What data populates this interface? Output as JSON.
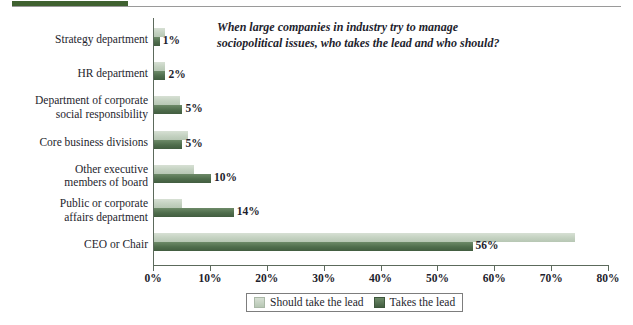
{
  "top_bar": {
    "accent_color": "#3f6130",
    "rule_color": "#9a9a9a"
  },
  "chart_data": {
    "type": "bar",
    "orientation": "horizontal",
    "title": "When large companies in industry try to manage\nsociopolitical issues, who takes the lead and who should?",
    "xlabel": "",
    "ylabel": "",
    "xlim": [
      0,
      80
    ],
    "grid": false,
    "legend_position": "bottom-center",
    "categories": [
      "Strategy department",
      "HR department",
      "Department of corporate\nsocial responsibility",
      "Core business divisions",
      "Other executive\nmembers of board",
      "Public or corporate\naffairs department",
      "CEO or Chair"
    ],
    "tick_labels": [
      "0%",
      "10%",
      "20%",
      "30%",
      "40%",
      "50%",
      "60%",
      "70%",
      "80%"
    ],
    "tick_values": [
      0,
      10,
      20,
      30,
      40,
      50,
      60,
      70,
      80
    ],
    "series": [
      {
        "name": "Should take the lead",
        "color": "#c3d1c0",
        "values": [
          2,
          2,
          4.5,
          6,
          7,
          5,
          74
        ],
        "labels": [
          "",
          "",
          "",
          "",
          "",
          "",
          ""
        ]
      },
      {
        "name": "Takes the lead",
        "color": "#4f6d4c",
        "values": [
          1,
          2,
          5,
          5,
          10,
          14,
          56
        ],
        "labels": [
          "1%",
          "2%",
          "5%",
          "5%",
          "10%",
          "14%",
          "56%"
        ]
      }
    ]
  },
  "legend": {
    "items": [
      {
        "label": "Should take the lead",
        "swatch": "light-green-swatch"
      },
      {
        "label": "Takes the lead",
        "swatch": "dark-green-swatch"
      }
    ]
  }
}
